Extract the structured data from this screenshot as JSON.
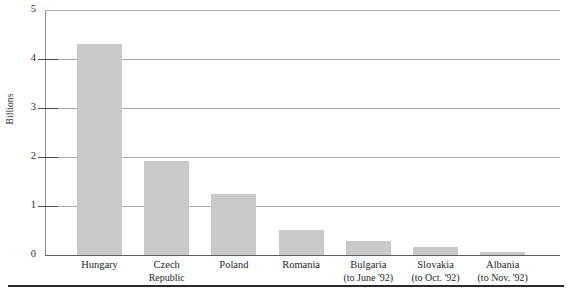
{
  "chart_data": {
    "type": "bar",
    "title": "",
    "xlabel": "",
    "ylabel": "Billions",
    "ylim": [
      0,
      5
    ],
    "yticks": [
      0,
      1,
      2,
      3,
      4,
      5
    ],
    "ytick_labels": [
      "0",
      "1",
      "2",
      "3",
      "4",
      "5"
    ],
    "grid": true,
    "legend": "none",
    "bar_color": "#c9c9c9",
    "categories": [
      "Hungary",
      "Czech Republic",
      "Poland",
      "Romania",
      "Bulgaria",
      "Slovakia",
      "Albania"
    ],
    "category_labels": [
      {
        "line1": "Hungary",
        "line2": ""
      },
      {
        "line1": "Czech",
        "line2": "Republic"
      },
      {
        "line1": "Poland",
        "line2": ""
      },
      {
        "line1": "Romania",
        "line2": ""
      },
      {
        "line1": "Bulgaria",
        "line2": "(to June '92)"
      },
      {
        "line1": "Slovakia",
        "line2": "(to Oct. '92)"
      },
      {
        "line1": "Albania",
        "line2": "(to Nov. '92)"
      }
    ],
    "values": [
      4.31,
      1.91,
      1.25,
      0.51,
      0.28,
      0.16,
      0.06
    ]
  }
}
